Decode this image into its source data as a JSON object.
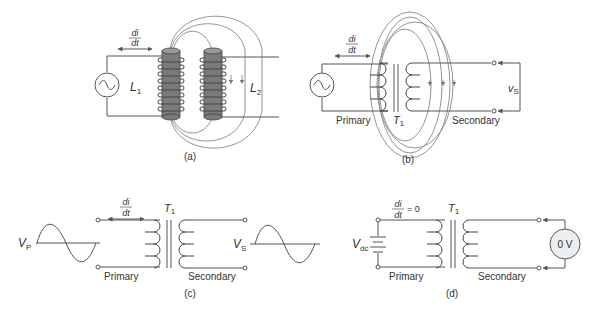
{
  "panels": {
    "a": {
      "caption": "(a)",
      "didt_num": "di",
      "didt_den": "dt",
      "inductor1": {
        "letter": "L",
        "sub": "1"
      },
      "inductor2": {
        "letter": "L",
        "sub": "2"
      }
    },
    "b": {
      "caption": "(b)",
      "didt_num": "di",
      "didt_den": "dt",
      "primary_label": "Primary",
      "secondary_label": "Secondary",
      "transformer": {
        "letter": "T",
        "sub": "1"
      },
      "output": {
        "letter": "v",
        "sub": "S"
      }
    },
    "c": {
      "caption": "(c)",
      "didt_num": "di",
      "didt_den": "dt",
      "primary_label": "Primary",
      "secondary_label": "Secondary",
      "transformer": {
        "letter": "T",
        "sub": "1"
      },
      "input": {
        "letter": "V",
        "sub": "P"
      },
      "output": {
        "letter": "V",
        "sub": "S"
      }
    },
    "d": {
      "caption": "(d)",
      "didt_num": "di",
      "didt_den": "dt",
      "didt_eq": "= 0",
      "primary_label": "Primary",
      "secondary_label": "Secondary",
      "transformer": {
        "letter": "T",
        "sub": "1"
      },
      "source": {
        "letter": "V",
        "sub": "dc"
      },
      "meter_reading": "0 V"
    }
  },
  "icons": [
    "ac-source-icon",
    "dc-battery-icon",
    "voltmeter-icon",
    "sine-wave-icon",
    "transformer-icon",
    "inductor-coil-icon"
  ],
  "colors": {
    "line": "#555555",
    "flux": "#888888",
    "core": "#7a7a7a",
    "text": "#333333",
    "meter_fill": "#eeeeee"
  }
}
